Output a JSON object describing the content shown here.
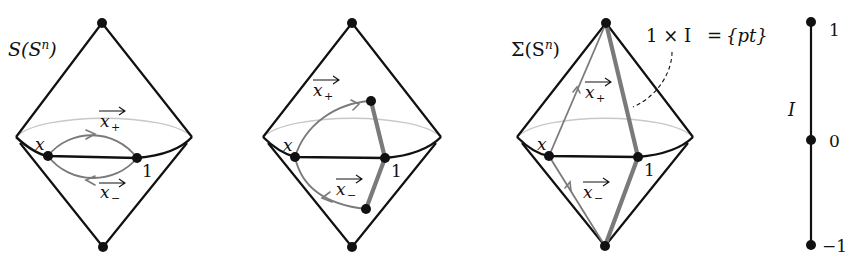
{
  "figure": {
    "panels": [
      {
        "id": "suspension-S",
        "title": "S(S^n)",
        "title_parts": {
          "base": "S(S",
          "sup": "n",
          "close": ")"
        },
        "point_x_label": "x",
        "point_one_label": "1",
        "x_plus_label": "x",
        "x_plus_sub": "+",
        "x_minus_label": "x",
        "x_minus_sub": "−"
      },
      {
        "id": "homotopy",
        "point_x_label": "x",
        "point_one_label": "1",
        "x_plus_label": "x",
        "x_plus_sub": "+",
        "x_minus_label": "x",
        "x_minus_sub": "−"
      },
      {
        "id": "reduced-suspension",
        "title_parts": {
          "base": "Σ(S",
          "sup": "n",
          "close": ")"
        },
        "point_x_label": "x",
        "point_one_label": "1",
        "x_plus_label": "x",
        "x_plus_sub": "+",
        "x_minus_label": "x",
        "x_minus_sub": "−",
        "annotation": {
          "lhs": "1 × I",
          "eq": "=",
          "rhs": "{pt}"
        }
      }
    ],
    "interval": {
      "label": "I",
      "ticks": [
        "1",
        "0",
        "−1"
      ]
    }
  },
  "colors": {
    "ink": "#111111",
    "grey_path": "#7a7a7a",
    "back_equator": "#c8c8c8",
    "background": "#ffffff"
  }
}
